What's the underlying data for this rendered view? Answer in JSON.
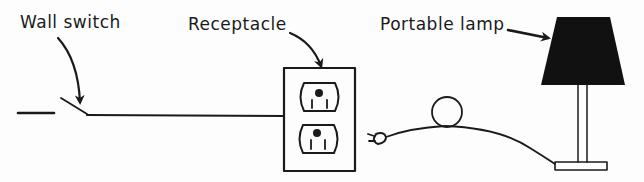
{
  "figure": {
    "labels": {
      "wall_switch": "Wall switch",
      "receptacle": "Receptacle",
      "portable_lamp": "Portable lamp"
    },
    "colors": {
      "ink": "#1a1a1a",
      "background": "#fdfdfd"
    }
  }
}
